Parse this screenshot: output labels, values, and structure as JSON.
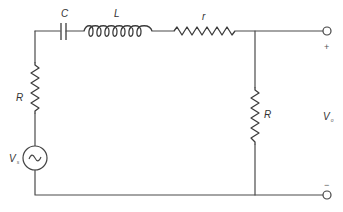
{
  "diagram": {
    "type": "circuit-schematic",
    "components": {
      "capacitor": {
        "label": "C"
      },
      "inductor": {
        "label": "L"
      },
      "series_resistor": {
        "label": "r"
      },
      "source_resistor": {
        "label": "R"
      },
      "load_resistor": {
        "label": "R"
      },
      "source": {
        "label": "V",
        "subscript": "s",
        "symbol": "~"
      }
    },
    "output": {
      "label": "V",
      "subscript": "o",
      "positive": "+",
      "negative": "−"
    }
  }
}
